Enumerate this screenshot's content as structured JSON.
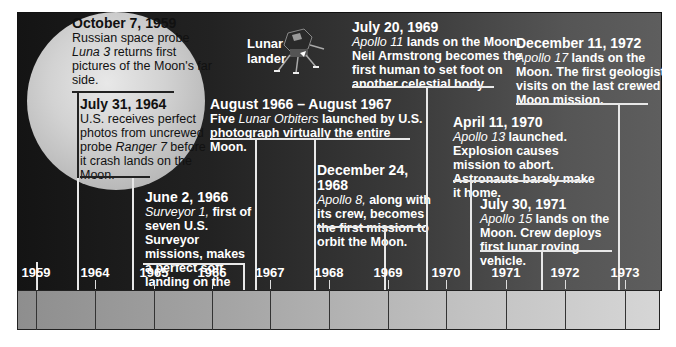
{
  "colors": {
    "panel_dark": "#141414",
    "panel_light": "#5e5e5e",
    "moon": "#d2d2d2",
    "text": "#ffffff",
    "bar": "#b0b0b0"
  },
  "illustration": {
    "label_line1": "Lunar",
    "label_line2": "lander",
    "icon": "lunar-lander-icon"
  },
  "events": [
    {
      "date": "October 7, 1959",
      "desc_pre": "Russian space probe ",
      "desc_em": "Luna 3",
      "desc_post": " returns first pictures of the Moon's far side."
    },
    {
      "date": "July 31, 1964",
      "desc_pre": "U.S. receives perfect photos from uncrewed probe ",
      "desc_em": "Ranger 7",
      "desc_post": " before it crash lands on the Moon."
    },
    {
      "date": "June 2, 1966",
      "desc_pre": "",
      "desc_em": "Surveyor 1,",
      "desc_post": " first of seven U.S. Surveyor missions, makes a perfect soft landing on the Moon."
    },
    {
      "date": "August 1966 – August 1967",
      "desc_pre": "Five ",
      "desc_em": "Lunar Orbiters",
      "desc_post": " launched by U.S. photograph virtually the entire Moon."
    },
    {
      "date": "December 24, 1968",
      "desc_pre": "",
      "desc_em": "Apollo 8,",
      "desc_post": " along with its crew, becomes the first mission to orbit the Moon."
    },
    {
      "date": "July 20, 1969",
      "desc_pre": "",
      "desc_em": "Apollo 11",
      "desc_post": " lands on the Moon. Neil Armstrong becomes the first human to set foot on another celestial body."
    },
    {
      "date": "April 11, 1970",
      "desc_pre": "",
      "desc_em": "Apollo 13",
      "desc_post": " launched. Explosion causes mission to abort. Astronauts barely make it home."
    },
    {
      "date": "July 30, 1971",
      "desc_pre": "",
      "desc_em": "Apollo 15",
      "desc_post": " lands on the Moon. Crew deploys first lunar roving vehicle."
    },
    {
      "date": "December 11, 1972",
      "desc_pre": "",
      "desc_em": "Apollo 17",
      "desc_post": " lands on the Moon. The first geologist visits on the last crewed Moon mission."
    }
  ],
  "years": [
    "1959",
    "1964",
    "1965",
    "1966",
    "1967",
    "1968",
    "1969",
    "1970",
    "1971",
    "1972",
    "1973"
  ]
}
